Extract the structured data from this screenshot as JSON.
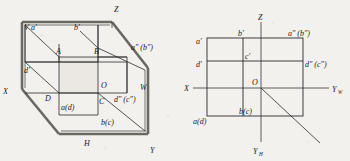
{
  "figure": {
    "colors": {
      "ink": "#1a1a1a",
      "line": "#2b2b2b",
      "thick_edge": "#5a5752",
      "axis": "#4a4a4a",
      "paper": "#f3f1ee",
      "shade": "#e6e3de"
    }
  },
  "left_view": {
    "name": "pictorial-projection-box",
    "caption": "Projection box with V, H and W planes unfolded",
    "axis_labels": [
      {
        "id": "Z",
        "text": "Z",
        "x": 114,
        "y": 12
      },
      {
        "id": "X",
        "text": "X",
        "x": 4,
        "y": 92
      },
      {
        "id": "Y",
        "text": "Y",
        "x": 150,
        "y": 152
      }
    ],
    "plane_labels": [
      {
        "id": "V",
        "text": "V",
        "x": 24,
        "y": 27
      },
      {
        "id": "W",
        "text": "W",
        "x": 142,
        "y": 88
      },
      {
        "id": "H",
        "text": "H",
        "x": 86,
        "y": 145
      }
    ],
    "point_labels": [
      {
        "id": "a-prime",
        "text": "a′",
        "x": 31,
        "y": 27
      },
      {
        "id": "b-prime",
        "text": "b′",
        "x": 74,
        "y": 26
      },
      {
        "id": "A",
        "text": "A",
        "x": 59,
        "y": 52
      },
      {
        "id": "B",
        "text": "B",
        "x": 96,
        "y": 52
      },
      {
        "id": "d-prime",
        "text": "d′",
        "x": 25,
        "y": 70
      },
      {
        "id": "O",
        "text": "O",
        "x": 104,
        "y": 84
      },
      {
        "id": "D",
        "text": "D",
        "x": 46,
        "y": 98
      },
      {
        "id": "C",
        "text": "C",
        "x": 101,
        "y": 101
      },
      {
        "id": "a-d",
        "text": "a(d)",
        "x": 61,
        "y": 107
      },
      {
        "id": "b-c",
        "text": "b(c)",
        "x": 102,
        "y": 122
      },
      {
        "id": "a2-b2",
        "text": "a″ (b″)",
        "x": 134,
        "y": 47
      },
      {
        "id": "d2-c2",
        "text": "d″ (c″)",
        "x": 117,
        "y": 99
      }
    ]
  },
  "right_view": {
    "name": "three-view-orthographic-drawing",
    "caption": "Unfolded three-view drawing with X, Yw, Yh and Z axes",
    "axis_labels": [
      {
        "id": "Z",
        "text": "Z",
        "sub": "",
        "x": 259,
        "y": 17
      },
      {
        "id": "X",
        "text": "X",
        "sub": "",
        "x": 185,
        "y": 93
      },
      {
        "id": "Yw",
        "text": "Y",
        "sub": "W",
        "x": 333,
        "y": 94
      },
      {
        "id": "Yh",
        "text": "Y",
        "sub": "H",
        "x": 255,
        "y": 152
      },
      {
        "id": "O",
        "text": "O",
        "sub": "",
        "x": 263,
        "y": 84
      }
    ],
    "point_labels": [
      {
        "id": "a-prime",
        "text": "a′",
        "x": 198,
        "y": 41
      },
      {
        "id": "b-prime",
        "text": "b′",
        "x": 240,
        "y": 34
      },
      {
        "id": "a2-b2",
        "text": "a″ (b″)",
        "x": 290,
        "y": 34
      },
      {
        "id": "d-prime",
        "text": "d′",
        "x": 198,
        "y": 65
      },
      {
        "id": "c-prime",
        "text": "c′",
        "x": 243,
        "y": 64
      },
      {
        "id": "d2-c2",
        "text": "d″ (c″)",
        "x": 305,
        "y": 65
      },
      {
        "id": "b-c",
        "text": "b(c)",
        "x": 239,
        "y": 113
      },
      {
        "id": "a-d",
        "text": "a(d)",
        "x": 196,
        "y": 122
      }
    ]
  }
}
